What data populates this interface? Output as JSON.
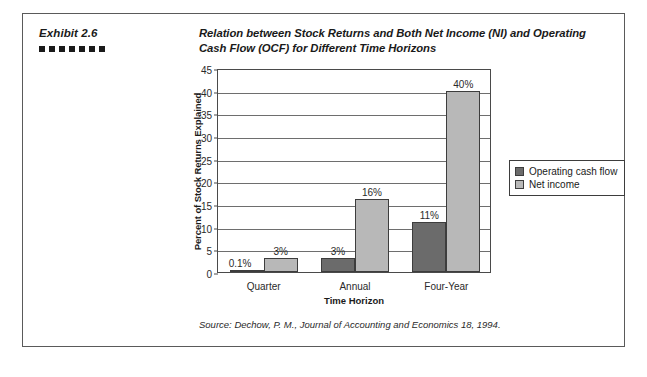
{
  "exhibit": {
    "number_label": "Exhibit 2.6",
    "dot_count": 7,
    "title": "Relation between Stock Returns and Both Net Income (NI) and Operating Cash Flow (OCF) for Different Time Horizons",
    "source_note": "Source: Dechow, P. M., Journal of Accounting and Economics 18, 1994."
  },
  "colors": {
    "operating_cash_flow": "#6b6b6b",
    "net_income": "#b8b8b8",
    "axis": "#4a4a4a",
    "gridline": "#6e6e6e",
    "frame": "#5a5a5a",
    "text": "#1a1a1a"
  },
  "chart_data": {
    "type": "bar",
    "title": "Relation between Stock Returns and Both Net Income (NI) and Operating Cash Flow (OCF) for Different Time Horizons",
    "xlabel": "Time Horizon",
    "ylabel": "Percent of Stock Returns Explained",
    "categories": [
      "Quarter",
      "Annual",
      "Four-Year"
    ],
    "series": [
      {
        "name": "Operating cash flow",
        "color": "#6b6b6b",
        "values": [
          0.1,
          3,
          11
        ],
        "labels": [
          "0.1%",
          "3%",
          "11%"
        ]
      },
      {
        "name": "Net income",
        "color": "#b8b8b8",
        "values": [
          3,
          16,
          40
        ],
        "labels": [
          "3%",
          "16%",
          "40%"
        ]
      }
    ],
    "ylim": [
      0,
      45
    ],
    "yticks": [
      0,
      5,
      10,
      15,
      20,
      25,
      30,
      35,
      40,
      45
    ],
    "ytick_labels": [
      "0",
      "5",
      "10",
      "15",
      "20",
      "25",
      "30",
      "35",
      "40",
      "45"
    ],
    "grid": true,
    "grid_axis": "y",
    "legend_position": "right"
  }
}
